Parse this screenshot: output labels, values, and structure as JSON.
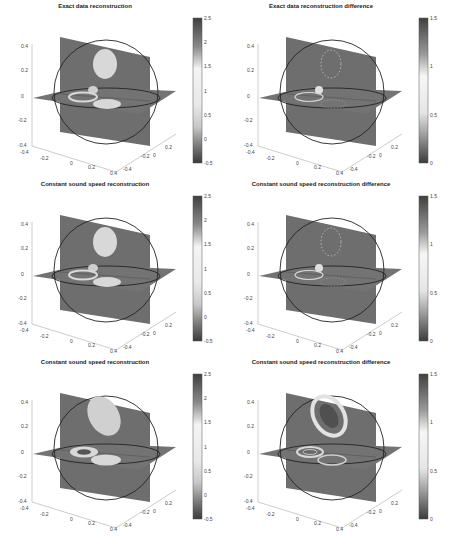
{
  "figure": {
    "layout": "3 rows x 2 columns of 3D orthogonal slice plots with colorbars",
    "colormap": "grayscale-like (dark at extremes, light at middle)"
  },
  "chart_data": [
    {
      "type": "heatmap",
      "subtype": "3d-orthogonal-slices",
      "title": "Exact data reconstruction",
      "axes": {
        "z_ticks": [
          "0.4",
          "0.2",
          "0",
          "-0.2",
          "-0.4"
        ],
        "x_ticks": [
          "-0.4",
          "-0.2",
          "0",
          "0.2",
          "0.4"
        ],
        "y_ticks": [
          "-0.4",
          "-0.2",
          "0",
          "0.2"
        ]
      },
      "colorbar": {
        "min": -0.5,
        "max": 2.5,
        "ticks": [
          "2.5",
          "2",
          "1.5",
          "1",
          "0.5",
          "0",
          "-0.5"
        ]
      },
      "features": [
        "upper bright ellipse on vertical slice",
        "small bright blob near center",
        "ring inclusion on horizontal slice",
        "bright ellipse on horizontal slice"
      ]
    },
    {
      "type": "heatmap",
      "subtype": "3d-orthogonal-slices",
      "title": "Exact data reconstruction difference",
      "axes": {
        "z_ticks": [
          "0.4",
          "0.2",
          "0",
          "-0.2",
          "-0.4"
        ],
        "x_ticks": [
          "-0.4",
          "-0.2",
          "0",
          "0.2",
          "0.4"
        ],
        "y_ticks": [
          "-0.4",
          "-0.2",
          "0",
          "0.2"
        ]
      },
      "colorbar": {
        "min": 0,
        "max": 1.5,
        "ticks": [
          "1.5",
          "1",
          "0.5",
          "0"
        ]
      },
      "features": [
        "faint dotted outline of upper ellipse",
        "bright small blob",
        "ring outline on horizontal slice"
      ]
    },
    {
      "type": "heatmap",
      "subtype": "3d-orthogonal-slices",
      "title": "Constant sound speed reconstruction",
      "axes": {
        "z_ticks": [
          "0.4",
          "0.2",
          "0",
          "-0.2",
          "-0.4"
        ],
        "x_ticks": [
          "-0.4",
          "-0.2",
          "0",
          "0.2",
          "0.4"
        ],
        "y_ticks": [
          "-0.4",
          "-0.2",
          "0",
          "0.2"
        ]
      },
      "colorbar": {
        "min": -0.5,
        "max": 2.5,
        "ticks": [
          "2.5",
          "2",
          "1.5",
          "1",
          "0.5",
          "0",
          "-0.5"
        ]
      },
      "features": [
        "upper bright ellipse",
        "small blob",
        "ring inclusion",
        "bright ellipse on horizontal slice"
      ]
    },
    {
      "type": "heatmap",
      "subtype": "3d-orthogonal-slices",
      "title": "Constant sound speed reconstruction difference",
      "axes": {
        "z_ticks": [
          "0.4",
          "0.2",
          "0",
          "-0.2",
          "-0.4"
        ],
        "x_ticks": [
          "-0.4",
          "-0.2",
          "0",
          "0.2",
          "0.4"
        ],
        "y_ticks": [
          "-0.4",
          "-0.2",
          "0",
          "0.2"
        ]
      },
      "colorbar": {
        "min": 0,
        "max": 1.5,
        "ticks": [
          "1.5",
          "1",
          "0.5",
          "0"
        ]
      },
      "features": [
        "dotted outline of upper ellipse",
        "bright small blob",
        "ring outline"
      ]
    },
    {
      "type": "heatmap",
      "subtype": "3d-orthogonal-slices",
      "title": "Constant sound speed reconstruction",
      "axes": {
        "z_ticks": [
          "0.4",
          "0.2",
          "0",
          "-0.2",
          "-0.4"
        ],
        "x_ticks": [
          "-0.4",
          "-0.2",
          "0",
          "0.2",
          "0.4"
        ],
        "y_ticks": [
          "-0.4",
          "-0.2",
          "0",
          "0.2"
        ]
      },
      "colorbar": {
        "min": -0.5,
        "max": 2.5,
        "ticks": [
          "2.5",
          "2",
          "1.5",
          "1",
          "0.5",
          "0",
          "-0.5"
        ]
      },
      "features": [
        "large tilted bright ellipse (distorted)",
        "ring with dark center",
        "bright ellipse on horizontal slice"
      ]
    },
    {
      "type": "heatmap",
      "subtype": "3d-orthogonal-slices",
      "title": "Constant sound speed reconstruction difference",
      "axes": {
        "z_ticks": [
          "0.4",
          "0.2",
          "0",
          "-0.2",
          "-0.4"
        ],
        "x_ticks": [
          "-0.4",
          "-0.2",
          "0",
          "0.2",
          "0.4"
        ],
        "y_ticks": [
          "-0.4",
          "-0.2",
          "0",
          "0.2"
        ]
      },
      "colorbar": {
        "min": 0,
        "max": 1.5,
        "ticks": [
          "1.5",
          "1",
          "0.5",
          "0"
        ]
      },
      "features": [
        "bright ring around tilted upper ellipse",
        "double ring outline on horizontal slice",
        "ring outline of lower ellipse"
      ]
    }
  ],
  "panels": [
    {
      "title": "Exact data reconstruction",
      "cb": [
        "2.5",
        "2",
        "1.5",
        "1",
        "0.5",
        "0",
        "-0.5"
      ]
    },
    {
      "title": "Exact data reconstruction difference",
      "cb": [
        "1.5",
        "1",
        "0.5",
        "0"
      ]
    },
    {
      "title": "Constant sound speed reconstruction",
      "cb": [
        "2.5",
        "2",
        "1.5",
        "1",
        "0.5",
        "0",
        "-0.5"
      ]
    },
    {
      "title": "Constant sound speed reconstruction difference",
      "cb": [
        "1.5",
        "1",
        "0.5",
        "0"
      ]
    },
    {
      "title": "Constant sound speed reconstruction",
      "cb": [
        "2.5",
        "2",
        "1.5",
        "1",
        "0.5",
        "0",
        "-0.5"
      ]
    },
    {
      "title": "Constant sound speed reconstruction difference",
      "cb": [
        "1.5",
        "1",
        "0.5",
        "0"
      ]
    }
  ],
  "ticks": {
    "z": [
      "0.4",
      "0.2",
      "0",
      "-0.2",
      "-0.4"
    ],
    "x": [
      "-0.4",
      "-0.2",
      "0",
      "0.2",
      "0.4"
    ],
    "y": [
      "-0.4",
      "-0.2",
      "0",
      "0.2"
    ]
  }
}
